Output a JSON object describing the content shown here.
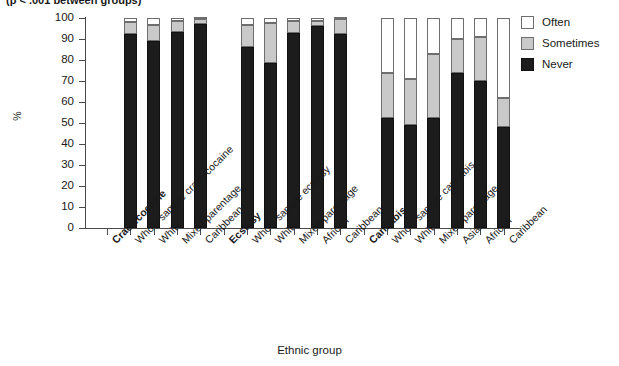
{
  "clipped_title": "(p < .001 between groups)",
  "chart_data": {
    "type": "bar",
    "subtype": "stacked-bar-100",
    "title": "",
    "xlabel": "Ethnic group",
    "ylabel": "%",
    "ylim": [
      0,
      100
    ],
    "ytick_step": 10,
    "grid": false,
    "legend_position": "top-right",
    "legend": [
      "Often",
      "Sometimes",
      "Never"
    ],
    "series": [
      {
        "name": "Never",
        "color": "#1c1c1c",
        "values": [
          92.5,
          89.0,
          93.5,
          97.0,
          86.0,
          78.5,
          93.0,
          96.0,
          92.5,
          52.5,
          49.0,
          52.5,
          74.0,
          70.0,
          48.0
        ]
      },
      {
        "name": "Sometimes",
        "color": "#c9c9c9",
        "values": [
          5.5,
          7.5,
          5.0,
          2.5,
          10.5,
          19.0,
          5.5,
          2.5,
          7.0,
          21.5,
          22.0,
          30.5,
          16.0,
          21.0,
          14.0
        ]
      },
      {
        "name": "Often",
        "color": "#ffffff",
        "values": [
          2.0,
          3.5,
          1.5,
          0.5,
          3.5,
          2.5,
          1.5,
          1.5,
          0.5,
          26.0,
          29.0,
          17.0,
          10.0,
          9.0,
          38.0
        ]
      }
    ],
    "ytick_labels": [
      "0",
      "10",
      "20",
      "30",
      "40",
      "50",
      "60",
      "70",
      "80",
      "90",
      "100"
    ],
    "axis_items": [
      {
        "label": "Crack/cocaine",
        "bold": true,
        "bar": false
      },
      {
        "label": "Whole sample crack/cocaine",
        "bold": false,
        "bar": true,
        "never": 92.5,
        "sometimes": 5.5,
        "often": 2.0
      },
      {
        "label": "White",
        "bold": false,
        "bar": true,
        "never": 89.0,
        "sometimes": 7.5,
        "often": 3.5
      },
      {
        "label": "Mixed parentage",
        "bold": false,
        "bar": true,
        "never": 93.5,
        "sometimes": 5.0,
        "often": 1.5
      },
      {
        "label": "Caribbean",
        "bold": false,
        "bar": true,
        "never": 97.0,
        "sometimes": 2.5,
        "often": 0.5
      },
      {
        "label": "Ecstasy",
        "bold": true,
        "bar": false
      },
      {
        "label": "Whole sample ecstasy",
        "bold": false,
        "bar": true,
        "never": 86.0,
        "sometimes": 10.5,
        "often": 3.5
      },
      {
        "label": "White",
        "bold": false,
        "bar": true,
        "never": 78.5,
        "sometimes": 19.0,
        "often": 2.5
      },
      {
        "label": "Mixed parentage",
        "bold": false,
        "bar": true,
        "never": 93.0,
        "sometimes": 5.5,
        "often": 1.5
      },
      {
        "label": "African",
        "bold": false,
        "bar": true,
        "never": 96.0,
        "sometimes": 2.5,
        "often": 1.5
      },
      {
        "label": "Caribbean",
        "bold": false,
        "bar": true,
        "never": 92.5,
        "sometimes": 7.0,
        "often": 0.5
      },
      {
        "label": "Cannabis",
        "bold": true,
        "bar": false
      },
      {
        "label": "Whole sample cannabis",
        "bold": false,
        "bar": true,
        "never": 52.5,
        "sometimes": 21.5,
        "often": 26.0
      },
      {
        "label": "White",
        "bold": false,
        "bar": true,
        "never": 49.0,
        "sometimes": 22.0,
        "often": 29.0
      },
      {
        "label": "Mixed parentage",
        "bold": false,
        "bar": true,
        "never": 52.5,
        "sometimes": 30.5,
        "often": 17.0
      },
      {
        "label": "Asian",
        "bold": false,
        "bar": true,
        "never": 74.0,
        "sometimes": 16.0,
        "often": 10.0
      },
      {
        "label": "African",
        "bold": false,
        "bar": true,
        "never": 70.0,
        "sometimes": 21.0,
        "often": 9.0
      },
      {
        "label": "Caribbean",
        "bold": false,
        "bar": true,
        "never": 48.0,
        "sometimes": 14.0,
        "often": 38.0
      }
    ]
  },
  "legend_items": [
    {
      "label": "Often",
      "swatch": "#ffffff",
      "border": "#6e6e6e"
    },
    {
      "label": "Sometimes",
      "swatch": "#c9c9c9",
      "border": "#6e6e6e"
    },
    {
      "label": "Never",
      "swatch": "#1c1c1c",
      "border": "#111111"
    }
  ]
}
